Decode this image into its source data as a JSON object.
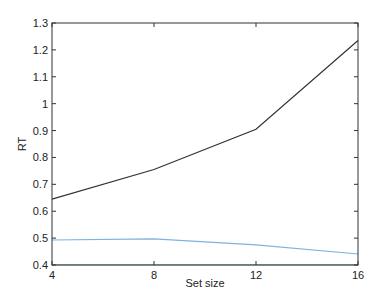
{
  "chart_data": {
    "type": "line",
    "title": "",
    "xlabel": "Set size",
    "ylabel": "RT",
    "x": [
      4,
      8,
      12,
      16
    ],
    "xticks": [
      "4",
      "8",
      "12",
      "16"
    ],
    "yticks": [
      "0.4",
      "0.5",
      "0.6",
      "0.7",
      "0.8",
      "0.9",
      "1",
      "1.1",
      "1.2",
      "1.3"
    ],
    "xlim": [
      4,
      16
    ],
    "ylim": [
      0.4,
      1.3
    ],
    "grid": false,
    "legend": null,
    "series": [
      {
        "name": "series-1",
        "color": "#333333",
        "values": [
          0.645,
          0.755,
          0.905,
          1.235
        ]
      },
      {
        "name": "series-2",
        "color": "#7fb2e0",
        "values": [
          0.493,
          0.497,
          0.475,
          0.441
        ]
      },
      {
        "name": "series-3",
        "color": "#a78bc9",
        "values": [
          0.401,
          0.401,
          0.401,
          0.401
        ]
      },
      {
        "name": "series-4",
        "color": "#9be29b",
        "values": [
          0.4,
          0.4,
          0.4,
          0.4
        ]
      }
    ]
  }
}
